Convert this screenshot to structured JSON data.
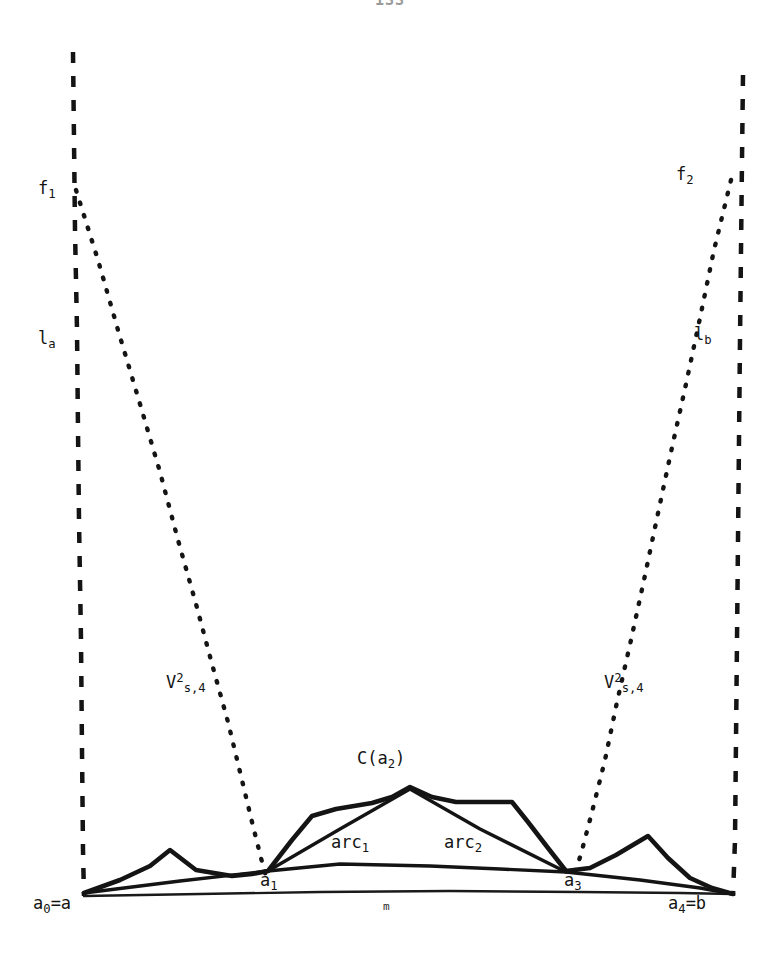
{
  "page": {
    "number": "133",
    "width": 780,
    "height": 976,
    "background": "#ffffff",
    "ink_color": "#141414"
  },
  "figure": {
    "labels": {
      "f1": {
        "text_main": "f",
        "subscript": "1"
      },
      "f2": {
        "text_main": "f",
        "subscript": "2"
      },
      "l_a": {
        "text_main": "l",
        "subscript": "a"
      },
      "l_b": {
        "text_main": "l",
        "subscript": "b"
      },
      "v_left": {
        "text_main": "V",
        "superscript": "2",
        "subscript": "s,4"
      },
      "v_right": {
        "text_main": "V",
        "superscript": "2",
        "subscript": "s,4"
      },
      "c_a2": {
        "prefix": "C(",
        "text_main": "a",
        "subscript": "2",
        "suffix": ")"
      },
      "arc1": {
        "text_main": "arc",
        "subscript": "1"
      },
      "arc2": {
        "text_main": "arc",
        "subscript": "2"
      },
      "a1": {
        "text_main": "a",
        "subscript": "1"
      },
      "a3": {
        "text_main": "a",
        "subscript": "3"
      },
      "a0_eq_a": {
        "text_main": "a",
        "subscript": "0",
        "suffix": "=a"
      },
      "a4_eq_b": {
        "text_main": "a",
        "subscript": "4",
        "suffix": "=b"
      },
      "m": {
        "text_main": "m"
      }
    },
    "strokes": {
      "dashed_left": {
        "name": "l_a vertical dashed line",
        "style": "dashed",
        "width": 4,
        "dasharray": "10 12",
        "points": "73,52 75,200 77,330 79,500 81,700 83,860 84,896"
      },
      "dashed_right": {
        "name": "l_b vertical dashed line",
        "style": "dashed",
        "width": 4,
        "dasharray": "10 12",
        "points": "742,75 740,200 738,360 736,520 735,700 734,860 733,896"
      },
      "dotted_left": {
        "name": "f1 dotted variation curve",
        "style": "dotted",
        "width": 4,
        "dasharray": "2 11",
        "points": "76,192 120,330 160,470 195,600 222,700 243,790 257,850 266,880"
      },
      "dotted_right": {
        "name": "f2 dotted variation curve",
        "style": "dotted",
        "width": 4,
        "dasharray": "2 11",
        "points": "730,182 700,320 672,450 645,570 620,680 597,780 578,850 570,882"
      },
      "baseline_m": {
        "name": "baseline segment m from a0 to a4",
        "style": "solid",
        "width": 2,
        "points": "84,896 300,893 500,891 733,893"
      },
      "chord_lower": {
        "name": "lower chord a0 to a1 to a3 to a4",
        "style": "solid",
        "width": 3,
        "points": "84,893 268,872 333,863 566,872 733,893"
      },
      "arc_chords": {
        "name": "straight chords arc1 (a1 to C(a2)) and arc2 (C(a2) to a3)",
        "style": "solid",
        "width": 3,
        "points": "268,872 410,788 566,872"
      },
      "curve_C": {
        "name": "piecewise linear curve C",
        "style": "solid",
        "width": 4,
        "points": "84,893 145,870 168,851 190,869 232,876 268,872 308,820 333,810 370,805 410,788 445,800 480,803 512,803 545,845 566,872 603,864 650,837 677,872 710,886 733,893"
      }
    }
  }
}
